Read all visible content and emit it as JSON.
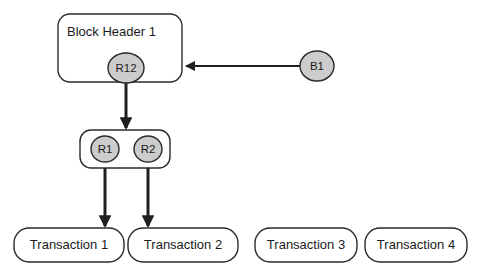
{
  "diagram": {
    "type": "block-merkle-tree-diagram",
    "background_color": "#ffffff",
    "stroke_color": "#1f1f1f",
    "node_fill_gray": "#cccccc",
    "box_fill": "#ffffff",
    "blocks": [
      {
        "id": "block-header",
        "label": "Block Header 1",
        "shape": "rounded-rect",
        "x": 58,
        "y": 14,
        "width": 124,
        "height": 68
      },
      {
        "id": "root-container",
        "label": "",
        "shape": "rounded-rect",
        "x": 80,
        "y": 130,
        "width": 90,
        "height": 38
      }
    ],
    "hash_nodes": [
      {
        "id": "r12",
        "label": "R12",
        "shape": "ellipse",
        "cx": 126,
        "cy": 68,
        "rx": 18,
        "ry": 15
      },
      {
        "id": "r1",
        "label": "R1",
        "shape": "ellipse",
        "cx": 105,
        "cy": 149,
        "rx": 14,
        "ry": 13
      },
      {
        "id": "r2",
        "label": "R2",
        "shape": "ellipse",
        "cx": 148,
        "cy": 149,
        "rx": 14,
        "ry": 13
      },
      {
        "id": "b1",
        "label": "B1",
        "shape": "ellipse",
        "cx": 317,
        "cy": 66,
        "rx": 17,
        "ry": 15
      }
    ],
    "transactions": [
      {
        "id": "transaction-1",
        "label": "Transaction 1",
        "x": 14,
        "y": 228,
        "width": 110,
        "height": 34,
        "has_incoming_arrow": true
      },
      {
        "id": "transaction-2",
        "label": "Transaction 2",
        "x": 128,
        "y": 228,
        "width": 110,
        "height": 34,
        "has_incoming_arrow": true
      },
      {
        "id": "transaction-3",
        "label": "Transaction 3",
        "x": 255,
        "y": 228,
        "width": 102,
        "height": 34,
        "has_incoming_arrow": false
      },
      {
        "id": "transaction-4",
        "label": "Transaction 4",
        "x": 365,
        "y": 228,
        "width": 102,
        "height": 34,
        "has_incoming_arrow": false
      }
    ],
    "connections": [
      {
        "id": "b1-to-block-header",
        "from": "b1",
        "to": "block-header",
        "direction": "right-to-left",
        "x1": 300,
        "y1": 66,
        "x2": 184,
        "y2": 66,
        "arrowhead": "end",
        "stroke_width": 2
      },
      {
        "id": "r12-to-root-container",
        "from": "r12",
        "to": "root-container",
        "direction": "top-to-bottom",
        "x1": 126,
        "y1": 80,
        "x2": 126,
        "y2": 129,
        "arrowhead": "end",
        "stroke_width": 3
      },
      {
        "id": "r1-to-transaction-1",
        "from": "r1",
        "to": "transaction-1",
        "direction": "top-to-bottom",
        "x1": 105,
        "y1": 160,
        "x2": 105,
        "y2": 227,
        "arrowhead": "end",
        "stroke_width": 3
      },
      {
        "id": "r2-to-transaction-2",
        "from": "r2",
        "to": "transaction-2",
        "direction": "top-to-bottom",
        "x1": 148,
        "y1": 160,
        "x2": 148,
        "y2": 227,
        "arrowhead": "end",
        "stroke_width": 3
      }
    ]
  }
}
